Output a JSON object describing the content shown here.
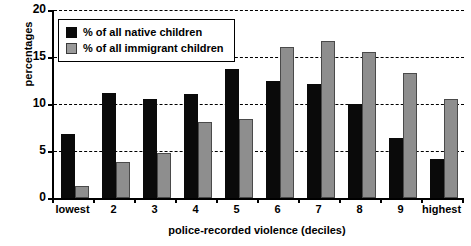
{
  "chart_data": {
    "type": "bar",
    "title": "",
    "xlabel": "police-recorded violence (deciles)",
    "ylabel": "percentages",
    "ylim": [
      0,
      20
    ],
    "yticks": [
      0,
      5,
      10,
      15,
      20
    ],
    "grid": true,
    "legend_position": "top-left",
    "categories": [
      "lowest",
      "2",
      "3",
      "4",
      "5",
      "6",
      "7",
      "8",
      "9",
      "highest"
    ],
    "series": [
      {
        "name": "% of all native children",
        "color": "#0a0a0a",
        "values": [
          6.8,
          11.2,
          10.5,
          11.1,
          13.7,
          12.4,
          12.1,
          10.0,
          6.4,
          4.2
        ]
      },
      {
        "name": "% of all immigrant children",
        "color": "#8e8e8e",
        "values": [
          1.3,
          3.8,
          4.8,
          8.1,
          8.4,
          16.1,
          16.7,
          15.5,
          13.3,
          10.5
        ]
      }
    ]
  },
  "axis": {
    "y_title": "percentages",
    "x_title": "police-recorded violence (deciles)",
    "y_tick_labels": [
      "20",
      "15",
      "10",
      "5",
      "0"
    ],
    "x_tick_labels": [
      "lowest",
      "2",
      "3",
      "4",
      "5",
      "6",
      "7",
      "8",
      "9",
      "highest"
    ]
  },
  "legend": {
    "items": [
      {
        "label": "% of all native children",
        "swatch": "native"
      },
      {
        "label": "% of all immigrant children",
        "swatch": "immigrant"
      }
    ]
  }
}
